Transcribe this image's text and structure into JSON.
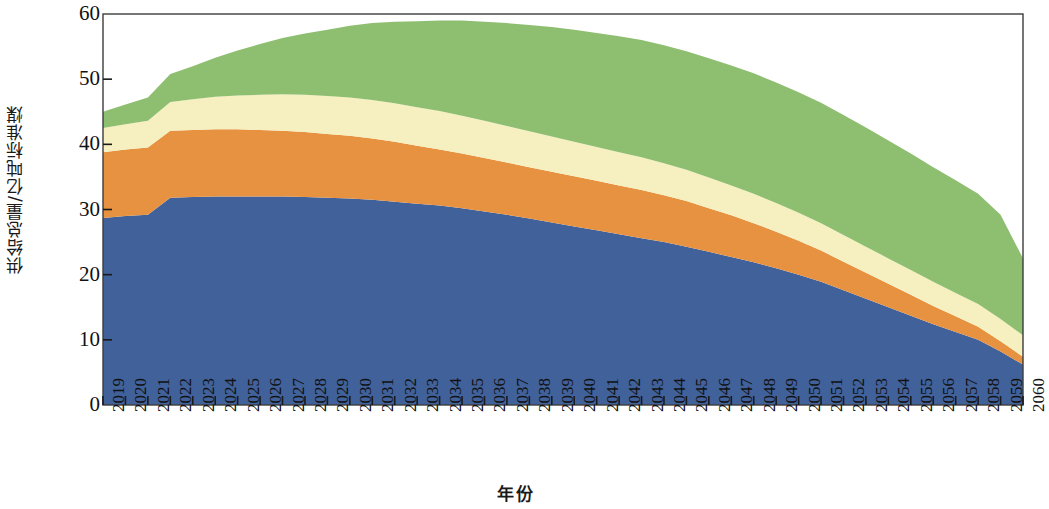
{
  "chart_data": {
    "type": "area",
    "title": "",
    "xlabel": "年份",
    "ylabel": "供给总量/亿吨标准煤",
    "stacked": true,
    "grid": false,
    "legend_position": "none",
    "xlim": [
      2019,
      2060
    ],
    "ylim": [
      0,
      60
    ],
    "y_ticks": [
      0,
      10,
      20,
      30,
      40,
      50,
      60
    ],
    "x_tick_labels": [
      "2019",
      "2020",
      "2021",
      "2022",
      "2023",
      "2024",
      "2025",
      "2026",
      "2027",
      "2028",
      "2029",
      "2030",
      "2031",
      "2032",
      "2033",
      "2034",
      "2035",
      "2036",
      "2037",
      "2038",
      "2039",
      "2040",
      "2041",
      "2042",
      "2043",
      "2044",
      "2045",
      "2046",
      "2047",
      "2048",
      "2049",
      "2050",
      "2051",
      "2052",
      "2053",
      "2054",
      "2055",
      "2056",
      "2057",
      "2058",
      "2059",
      "2060"
    ],
    "categories": [
      2019,
      2020,
      2021,
      2022,
      2023,
      2024,
      2025,
      2026,
      2027,
      2028,
      2029,
      2030,
      2031,
      2032,
      2033,
      2034,
      2035,
      2036,
      2037,
      2038,
      2039,
      2040,
      2041,
      2042,
      2043,
      2044,
      2045,
      2046,
      2047,
      2048,
      2049,
      2050,
      2051,
      2052,
      2053,
      2054,
      2055,
      2056,
      2057,
      2058,
      2059,
      2060
    ],
    "series": [
      {
        "name": "series-1",
        "color": "#41619B",
        "values": [
          28.7,
          29.0,
          29.2,
          31.8,
          31.9,
          32.0,
          32.0,
          32.0,
          32.0,
          31.9,
          31.8,
          31.7,
          31.5,
          31.2,
          30.9,
          30.6,
          30.2,
          29.7,
          29.2,
          28.6,
          28.0,
          27.4,
          26.8,
          26.2,
          25.6,
          25.0,
          24.3,
          23.5,
          22.7,
          21.9,
          21.0,
          20.0,
          18.9,
          17.6,
          16.3,
          15.0,
          13.7,
          12.4,
          11.2,
          10.0,
          8.2,
          6.2
        ]
      },
      {
        "name": "series-2",
        "color": "#E79240",
        "values": [
          10.1,
          10.2,
          10.3,
          10.3,
          10.3,
          10.3,
          10.3,
          10.2,
          10.1,
          10.0,
          9.8,
          9.6,
          9.4,
          9.2,
          8.9,
          8.6,
          8.4,
          8.2,
          8.0,
          7.9,
          7.8,
          7.7,
          7.6,
          7.5,
          7.4,
          7.2,
          7.0,
          6.7,
          6.4,
          6.0,
          5.6,
          5.2,
          4.8,
          4.4,
          4.0,
          3.6,
          3.2,
          2.8,
          2.4,
          2.0,
          1.6,
          1.2
        ]
      },
      {
        "name": "series-3",
        "color": "#F6EFBF",
        "values": [
          3.7,
          3.9,
          4.1,
          4.4,
          4.7,
          5.0,
          5.2,
          5.4,
          5.6,
          5.7,
          5.8,
          5.9,
          5.9,
          5.9,
          5.9,
          5.9,
          5.8,
          5.7,
          5.6,
          5.5,
          5.4,
          5.3,
          5.2,
          5.1,
          5.0,
          4.9,
          4.8,
          4.7,
          4.6,
          4.5,
          4.4,
          4.3,
          4.2,
          4.1,
          4.0,
          3.9,
          3.8,
          3.7,
          3.6,
          3.5,
          3.4,
          3.3
        ]
      },
      {
        "name": "series-4",
        "color": "#8EBE70",
        "values": [
          2.5,
          3.0,
          3.6,
          4.3,
          5.1,
          6.0,
          6.9,
          7.8,
          8.6,
          9.4,
          10.2,
          11.0,
          11.8,
          12.5,
          13.2,
          13.9,
          14.6,
          15.2,
          15.8,
          16.3,
          16.8,
          17.2,
          17.5,
          17.8,
          18.0,
          18.1,
          18.2,
          18.3,
          18.4,
          18.5,
          18.5,
          18.5,
          18.5,
          18.4,
          18.3,
          18.1,
          17.9,
          17.6,
          17.3,
          16.9,
          16.0,
          11.8
        ]
      }
    ],
    "totals": [
      45.0,
      46.1,
      47.2,
      50.8,
      52.0,
      53.3,
      54.4,
      55.4,
      56.3,
      57.0,
      57.6,
      58.2,
      58.6,
      58.8,
      58.9,
      59.0,
      59.0,
      58.8,
      58.6,
      58.3,
      58.0,
      57.6,
      57.1,
      56.6,
      56.0,
      55.2,
      54.3,
      53.2,
      52.1,
      50.9,
      49.5,
      48.0,
      46.4,
      44.5,
      42.6,
      40.6,
      38.6,
      36.5,
      34.5,
      32.4,
      29.2,
      22.5
    ]
  },
  "axis": {
    "frame_color": "#3c3c3c",
    "tick_color": "#1a1a1a",
    "background": "#ffffff"
  }
}
